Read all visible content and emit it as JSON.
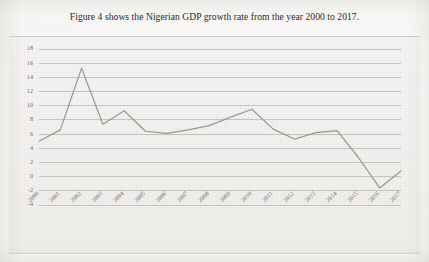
{
  "caption": "Figure 4 shows the Nigerian GDP growth rate from the year 2000 to 2017.",
  "colors": {
    "line": "#9b9894",
    "grid": "#a9a6a1",
    "plot_background": "#f2f1ef",
    "page_background": "#fafaf8",
    "axis_text": "#6e6a65",
    "caption_text": "#2a2724"
  },
  "chart_data": {
    "type": "line",
    "title": "",
    "subtitle": "",
    "xlabel": "",
    "ylabel": "",
    "categories": [
      "2000",
      "2001",
      "2002",
      "2003",
      "2004",
      "2005",
      "2006",
      "2007",
      "2008",
      "2009",
      "2010",
      "2011",
      "2012",
      "2013",
      "2014",
      "2015",
      "2016",
      "2017"
    ],
    "values": [
      5.0,
      6.6,
      15.3,
      7.4,
      9.3,
      6.4,
      6.1,
      6.6,
      7.2,
      8.4,
      9.5,
      6.7,
      5.3,
      6.2,
      6.5,
      2.7,
      -1.6,
      0.8
    ],
    "yticks": [
      -4,
      -2,
      0,
      2,
      4,
      6,
      8,
      10,
      12,
      14,
      16,
      18
    ],
    "ytick_labels": [
      "-4",
      "-2",
      "0",
      "2",
      "4",
      "6",
      "8",
      "10",
      "12",
      "14",
      "16",
      "18"
    ],
    "ylim": [
      -4,
      18
    ],
    "grid": true,
    "grid_axis": "y",
    "legend": false,
    "legend_position": "none",
    "series": [
      {
        "name": "Nigerian GDP growth rate",
        "values": [
          5.0,
          6.6,
          15.3,
          7.4,
          9.3,
          6.4,
          6.1,
          6.6,
          7.2,
          8.4,
          9.5,
          6.7,
          5.3,
          6.2,
          6.5,
          2.7,
          -1.6,
          0.8
        ]
      }
    ],
    "xtick_rotation": 45,
    "markers": false
  }
}
